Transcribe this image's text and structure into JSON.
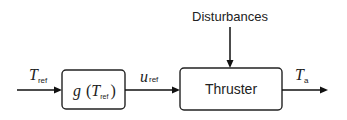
{
  "diagram": {
    "type": "block-diagram",
    "input": {
      "symbol": "T",
      "subscript": "ref"
    },
    "blocks": [
      {
        "id": "g",
        "function": "g",
        "arg_symbol": "T",
        "arg_subscript": "ref",
        "open_paren": "(",
        "close_paren": ")"
      },
      {
        "id": "thruster",
        "label": "Thruster"
      }
    ],
    "intermediate": {
      "symbol": "u",
      "subscript": "ref"
    },
    "disturbance": {
      "label": "Disturbances"
    },
    "output": {
      "symbol": "T",
      "subscript": "a"
    },
    "colors": {
      "stroke": "#222222",
      "background": "#ffffff"
    }
  }
}
